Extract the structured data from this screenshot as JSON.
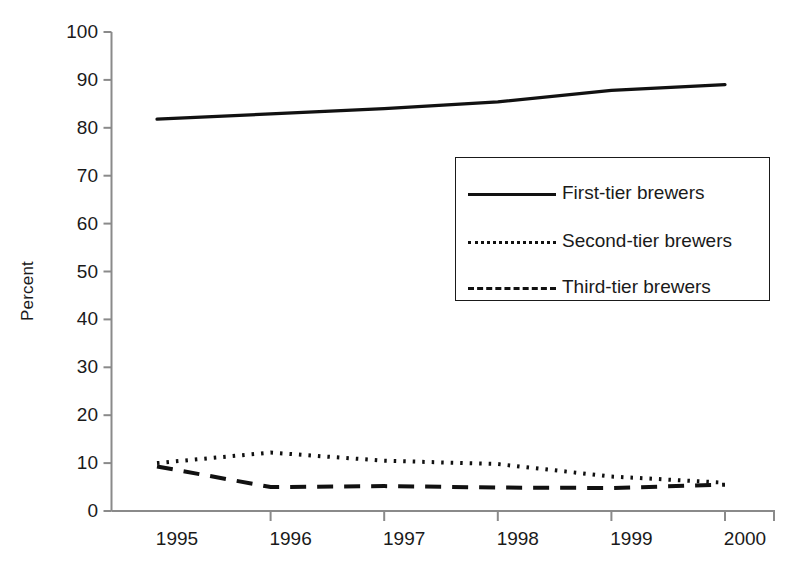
{
  "chart_data": {
    "type": "line",
    "title": "",
    "xlabel": "",
    "ylabel": "Percent",
    "grid": false,
    "legend_position": "center-right-inside",
    "x": [
      "1995",
      "1996",
      "1997",
      "1998",
      "1999",
      "2000"
    ],
    "xlim": [
      1995,
      2000
    ],
    "ylim": [
      0,
      100
    ],
    "ytick_labels": [
      "0",
      "10",
      "20",
      "30",
      "40",
      "50",
      "60",
      "70",
      "80",
      "90",
      "100"
    ],
    "ytick_values": [
      0,
      10,
      20,
      30,
      40,
      50,
      60,
      70,
      80,
      90,
      100
    ],
    "xtick_labels": [
      "1995",
      "1996",
      "1997",
      "1998",
      "1999",
      "2000"
    ],
    "series": [
      {
        "name": "First-tier brewers",
        "style": "solid",
        "color": "#111111",
        "values": [
          81.8,
          82.9,
          84.0,
          85.4,
          87.8,
          89.0
        ]
      },
      {
        "name": "Second-tier brewers",
        "style": "dotted",
        "color": "#111111",
        "values": [
          10.0,
          12.2,
          10.5,
          9.8,
          7.2,
          5.9
        ]
      },
      {
        "name": "Third-tier brewers",
        "style": "dashed",
        "color": "#111111",
        "values": [
          9.3,
          5.0,
          5.2,
          4.9,
          4.8,
          5.5
        ]
      }
    ]
  },
  "axis": {
    "y_title": "Percent"
  },
  "legend": {
    "entries": [
      {
        "label": "First-tier brewers",
        "style": "solid"
      },
      {
        "label": "Second-tier brewers",
        "style": "dotted"
      },
      {
        "label": "Third-tier brewers",
        "style": "dashed"
      }
    ]
  }
}
